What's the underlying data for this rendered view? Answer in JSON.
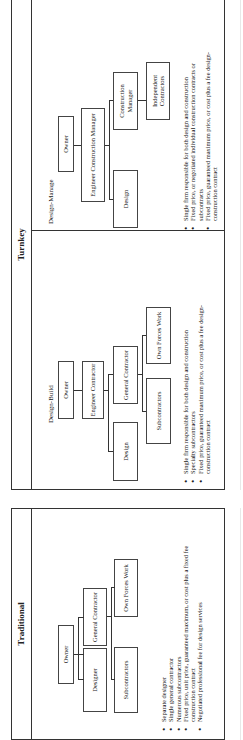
{
  "traditional": {
    "title": "Traditional",
    "boxes": {
      "owner": "Owner",
      "designer": "Designer",
      "general_contractor": "General Contractor",
      "subcontractors": "Subcontractors",
      "own_forces_work": "Own Forces Work"
    },
    "bullets": [
      "Separate designer",
      "Single general contractor",
      "Numerous subcontractors",
      "Fixed price, unit price, guaranteed maximum, or cost plus a fixed fee construction contract",
      "Negotiated professional fee for design services"
    ]
  },
  "turnkey": {
    "title": "Turnkey",
    "design_build": {
      "title": "Design-Build",
      "boxes": {
        "owner": "Owner",
        "engineer_contractor": "Engineer Contractor",
        "design": "Design",
        "general_contractor": "General Contractor",
        "subcontractors": "Subcontractors",
        "own_forces_work": "Own Forces Work"
      },
      "bullets": [
        "Single firm responsible for both design and construction",
        "Specialty subcontractors",
        "Fixed price, guaranteed maximum price, or cost plus a fee design-construction contract"
      ]
    },
    "design_manage": {
      "title": "Design-Manage",
      "boxes": {
        "owner": "Owner",
        "engineer_construction_manager": "Engineer Construction Manager",
        "design": "Design",
        "construction_manager": "Construction Manager",
        "independent_contractors": "Independent Contractors"
      },
      "bullets": [
        "Single firm responsible for both design and construction",
        "Fixed price, or negotiated individual construction contracts or subcontracts",
        "Fixed price, guaranteed maximum price, or cost plus a fee design-construction contract"
      ]
    }
  }
}
